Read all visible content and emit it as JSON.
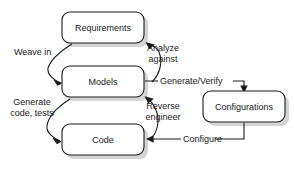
{
  "diagram": {
    "background_color": "#ffffff",
    "stroke_color": "#1a1a1a",
    "shadow_color": "#b0b0b0",
    "nodes": [
      {
        "id": "requirements",
        "label": "Requirements",
        "x": 62,
        "y": 12,
        "w": 82,
        "h": 31
      },
      {
        "id": "models",
        "label": "Models",
        "x": 62,
        "y": 66,
        "w": 82,
        "h": 31
      },
      {
        "id": "code",
        "label": "Code",
        "x": 62,
        "y": 124,
        "w": 82,
        "h": 31
      },
      {
        "id": "configurations",
        "label": "Configurations",
        "x": 203,
        "y": 91,
        "w": 82,
        "h": 31
      }
    ],
    "edges": [
      {
        "id": "weave-in",
        "label": "Weave in",
        "from": "requirements",
        "to": "models"
      },
      {
        "id": "analyze-against",
        "label": "Analyze\nagainst",
        "from": "models",
        "to": "requirements"
      },
      {
        "id": "generate-code",
        "label": "Generate\ncode, tests",
        "from": "models",
        "to": "code"
      },
      {
        "id": "reverse-engineer",
        "label": "Reverse\nengineer",
        "from": "code",
        "to": "models"
      },
      {
        "id": "generate-verify",
        "label": "Generate/Verify",
        "from": "models",
        "to": "configurations"
      },
      {
        "id": "configure",
        "label": "Configure",
        "from": "configurations",
        "to": "code"
      }
    ],
    "edge_label_lines": {
      "weave_in": [
        "Weave in"
      ],
      "analyze_against": [
        "Analyze",
        "against"
      ],
      "generate_code": [
        "Generate",
        "code, tests"
      ],
      "reverse_engineer": [
        "Reverse",
        "engineer"
      ],
      "generate_verify": [
        "Generate/Verify"
      ],
      "configure": [
        "Configure"
      ]
    }
  }
}
